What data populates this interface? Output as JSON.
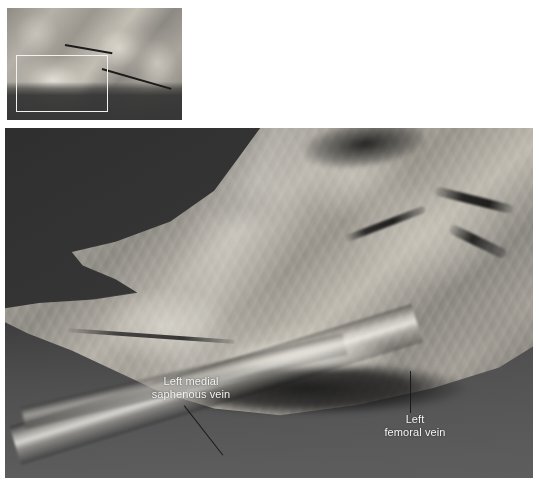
{
  "figure": {
    "type": "anatomical-dissection-photograph",
    "color_mode": "grayscale",
    "thumbnail": {
      "name": "overview-thumbnail",
      "description": "Wide overview of the dissected limb",
      "selection_rect": {
        "name": "region-of-interest-rectangle",
        "border_color": "#f2f2f2"
      }
    },
    "main_image": {
      "name": "magnified-dissection-view",
      "description": "Magnified view of the inguinal region showing the left medial saphenous vein and left femoral vein",
      "background_color": "#3e3e3e"
    },
    "annotations": [
      {
        "id": "saphenous",
        "label": "Left medial\nsaphenous vein",
        "text_color": "#f4f4f4",
        "leader_color": "#1a1a1a"
      },
      {
        "id": "femoral",
        "label": "Left\nfemoral vein",
        "text_color": "#f4f4f4",
        "leader_color": "#1a1a1a"
      }
    ]
  }
}
